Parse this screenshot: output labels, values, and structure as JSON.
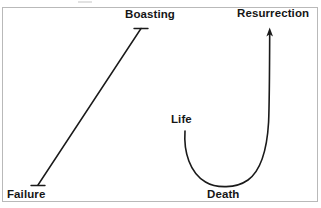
{
  "diagram": {
    "background_color": "#ffffff",
    "border_color": "#b9b9b9",
    "stroke_color": "#1a1a1a",
    "text_color": "#161616",
    "labels": {
      "boasting": "Boasting",
      "resurrection": "Resurrection",
      "failure": "Failure",
      "death": "Death",
      "life": "Life"
    },
    "paths": {
      "ascending_line": {
        "name": "failure-to-boasting-line",
        "from": "Failure",
        "to": "Boasting",
        "shape": "straight",
        "start": [
          38,
          185
        ],
        "end": [
          141,
          28
        ],
        "has_start_tick": true,
        "has_end_tick": true,
        "has_arrowhead": false
      },
      "u_curve": {
        "name": "life-death-resurrection-curve",
        "from": "Life",
        "through": "Death",
        "to": "Resurrection",
        "shape": "u-curve-with-arrow",
        "start": [
          185,
          131
        ],
        "bottom": [
          228,
          187
        ],
        "end": [
          269,
          30
        ],
        "has_arrowhead": true
      }
    }
  }
}
